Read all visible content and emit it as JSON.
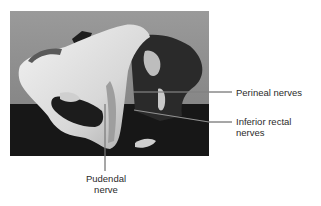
{
  "figure": {
    "photo_description": "Grayscale photograph of pelvis model showing pudendal nerve and branches",
    "labels": {
      "perineal": {
        "line1": "Perineal nerves"
      },
      "inferior_rectal": {
        "line1": "Inferior rectal",
        "line2": "nerves"
      },
      "pudendal": {
        "line1": "Pudendal",
        "line2": "nerve"
      }
    },
    "colors": {
      "background": "#ffffff",
      "photo_backdrop": "#8c8c8c",
      "photo_floor": "#181818",
      "bone": "#e6e6e6",
      "leader_line": "#3a3a3a",
      "label_text": "#2b2b2b"
    }
  }
}
